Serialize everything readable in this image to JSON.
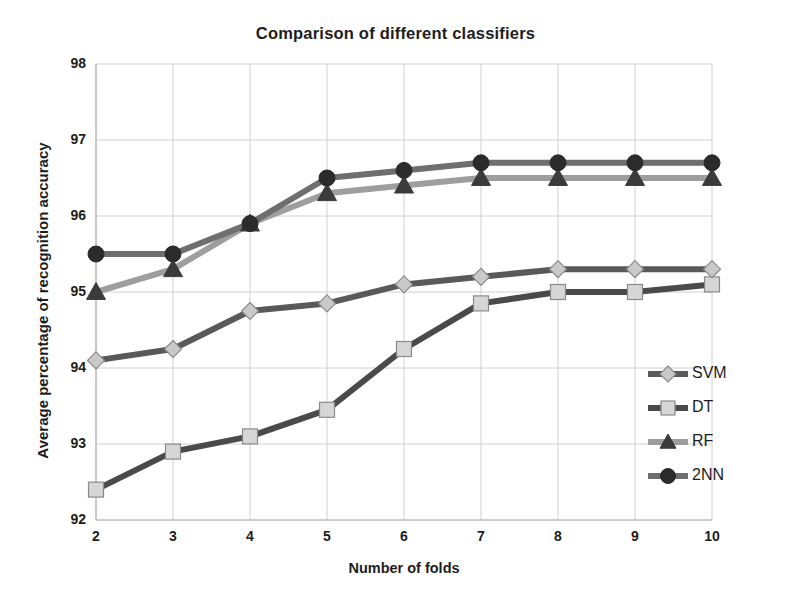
{
  "chart_data": {
    "type": "line",
    "title": "Comparison of different classifiers",
    "xlabel": "Number of folds",
    "ylabel": "Average percentage of recognition accuracy",
    "x": [
      2,
      3,
      4,
      5,
      6,
      7,
      8,
      9,
      10
    ],
    "xticklabels": [
      "2",
      "3",
      "4",
      "5",
      "6",
      "7",
      "8",
      "9",
      "10"
    ],
    "yticklabels": [
      "92",
      "93",
      "94",
      "95",
      "96",
      "97",
      "98"
    ],
    "xlim": [
      2,
      10
    ],
    "ylim": [
      92,
      98
    ],
    "ytick_step": 1,
    "grid": true,
    "legend_position": "center-right",
    "series": [
      {
        "name": "SVM",
        "marker": "diamond",
        "line_color": "#595959",
        "marker_fill": "#c9c9c9",
        "values": [
          94.1,
          94.25,
          94.75,
          94.85,
          95.1,
          95.2,
          95.3,
          95.3,
          95.3
        ]
      },
      {
        "name": "DT",
        "marker": "square",
        "line_color": "#4a4a4a",
        "marker_fill": "#d6d6d6",
        "values": [
          92.4,
          92.9,
          93.1,
          93.45,
          94.25,
          94.85,
          95.0,
          95.0,
          95.1
        ]
      },
      {
        "name": "RF",
        "marker": "triangle",
        "line_color": "#9e9e9e",
        "marker_fill": "#3b3b3b",
        "values": [
          95.0,
          95.3,
          95.9,
          96.3,
          96.4,
          96.5,
          96.5,
          96.5,
          96.5
        ]
      },
      {
        "name": "2NN",
        "marker": "circle",
        "line_color": "#6e6e6e",
        "marker_fill": "#2b2b2b",
        "values": [
          95.5,
          95.5,
          95.9,
          96.5,
          96.6,
          96.7,
          96.7,
          96.7,
          96.7
        ]
      }
    ]
  },
  "legend": {
    "items": [
      {
        "label": "SVM"
      },
      {
        "label": "DT"
      },
      {
        "label": "RF"
      },
      {
        "label": "2NN"
      }
    ]
  },
  "colors": {
    "background": "#ffffff",
    "grid": "#d0d0d0",
    "axis": "#b5b5b5",
    "text": "#1d1d1d"
  }
}
